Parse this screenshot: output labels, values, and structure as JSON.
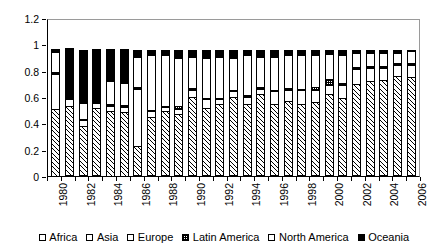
{
  "chart_data": {
    "type": "bar",
    "subtype": "stacked-100-percent",
    "title": "",
    "xlabel": "",
    "ylabel": "",
    "ylim": [
      0,
      1.2
    ],
    "ytick_labels": [
      "0",
      "0.2",
      "0.4",
      "0.6",
      "0.8",
      "1",
      "1.2"
    ],
    "ytick_values": [
      0,
      0.2,
      0.4,
      0.6,
      0.8,
      1,
      1.2
    ],
    "grid": false,
    "legend_position": "bottom",
    "categories": [
      "1980",
      "1981",
      "1982",
      "1983",
      "1984",
      "1985",
      "1986",
      "1987",
      "1988",
      "1989",
      "1990",
      "1991",
      "1992",
      "1993",
      "1994",
      "1995",
      "1996",
      "1997",
      "1998",
      "1999",
      "2000",
      "2001",
      "2002",
      "2003",
      "2004",
      "2005",
      "2006"
    ],
    "xtick_labels_shown": [
      "1980",
      "1982",
      "1984",
      "1986",
      "1988",
      "1990",
      "1992",
      "1994",
      "1996",
      "1998",
      "2000",
      "2002",
      "2004",
      "2006"
    ],
    "series": [
      {
        "name": "Africa",
        "pattern": "open-white",
        "values": [
          0.0,
          0.01,
          0.01,
          0.01,
          0.0,
          0.0,
          0.01,
          0.01,
          0.01,
          0.01,
          0.01,
          0.01,
          0.01,
          0.01,
          0.01,
          0.01,
          0.01,
          0.01,
          0.01,
          0.01,
          0.01,
          0.01,
          0.01,
          0.01,
          0.01,
          0.01,
          0.01
        ]
      },
      {
        "name": "Asia",
        "pattern": "diagonal-hatch",
        "values": [
          0.52,
          0.53,
          0.38,
          0.52,
          0.5,
          0.49,
          0.23,
          0.45,
          0.49,
          0.47,
          0.6,
          0.52,
          0.55,
          0.6,
          0.55,
          0.62,
          0.55,
          0.57,
          0.55,
          0.56,
          0.62,
          0.59,
          0.7,
          0.72,
          0.73,
          0.76,
          0.75
        ]
      },
      {
        "name": "Europe",
        "pattern": "plain-white",
        "values": [
          0.27,
          0.06,
          0.05,
          0.04,
          0.05,
          0.05,
          0.44,
          0.05,
          0.04,
          0.05,
          0.06,
          0.07,
          0.04,
          0.05,
          0.06,
          0.05,
          0.1,
          0.09,
          0.11,
          0.1,
          0.08,
          0.11,
          0.12,
          0.11,
          0.1,
          0.09,
          0.1
        ]
      },
      {
        "name": "Latin America",
        "pattern": "dotted",
        "values": [
          0.02,
          0.01,
          0.02,
          0.02,
          0.02,
          0.02,
          0.02,
          0.02,
          0.02,
          0.03,
          0.02,
          0.02,
          0.02,
          0.02,
          0.02,
          0.02,
          0.02,
          0.02,
          0.02,
          0.03,
          0.05,
          0.02,
          0.02,
          0.02,
          0.02,
          0.02,
          0.02
        ]
      },
      {
        "name": "North America",
        "pattern": "plain-white",
        "values": [
          0.16,
          0.01,
          0.13,
          0.01,
          0.18,
          0.18,
          0.24,
          0.42,
          0.39,
          0.37,
          0.25,
          0.31,
          0.32,
          0.25,
          0.31,
          0.24,
          0.26,
          0.26,
          0.26,
          0.25,
          0.2,
          0.22,
          0.12,
          0.11,
          0.11,
          0.09,
          0.1
        ]
      },
      {
        "name": "Oceania",
        "pattern": "solid-black",
        "values": [
          0.03,
          0.38,
          0.41,
          0.4,
          0.25,
          0.26,
          0.06,
          0.05,
          0.05,
          0.07,
          0.06,
          0.07,
          0.06,
          0.07,
          0.05,
          0.06,
          0.06,
          0.05,
          0.05,
          0.05,
          0.04,
          0.05,
          0.03,
          0.03,
          0.03,
          0.03,
          0.02
        ]
      }
    ]
  },
  "legend": {
    "items": [
      {
        "label": "Africa"
      },
      {
        "label": "Asia"
      },
      {
        "label": "Europe"
      },
      {
        "label": "Latin America"
      },
      {
        "label": "North America"
      },
      {
        "label": "Oceania"
      }
    ]
  }
}
